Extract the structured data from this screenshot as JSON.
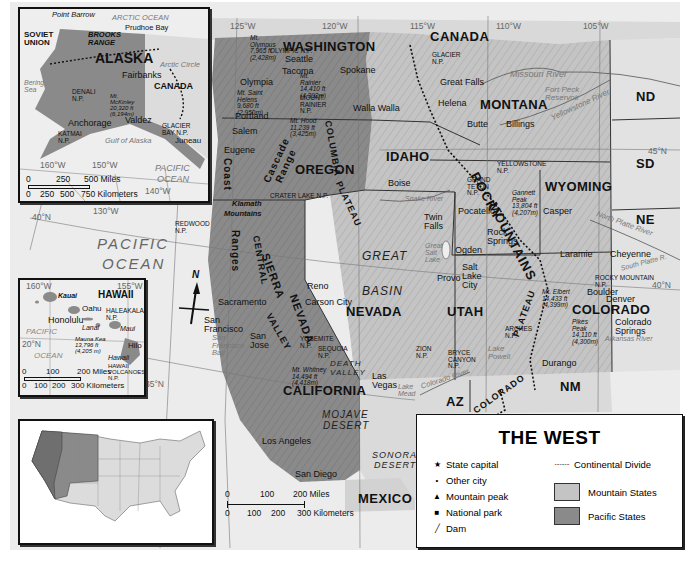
{
  "title": "THE WEST",
  "legend": {
    "title": "THE WEST",
    "items": [
      {
        "symbol": "★",
        "icon": "star-icon",
        "label": "State capital"
      },
      {
        "symbol": "•",
        "icon": "dot-icon",
        "label": "Other city"
      },
      {
        "symbol": "▲",
        "icon": "triangle-icon",
        "label": "Mountain peak"
      },
      {
        "symbol": "■",
        "icon": "square-icon",
        "label": "National park"
      },
      {
        "symbol": "╱",
        "icon": "dam-icon",
        "label": "Dam"
      }
    ],
    "line_items": [
      {
        "symbol": "·········",
        "icon": "dotted-line-icon",
        "label": "Continental Divide"
      }
    ],
    "fills": [
      {
        "label": "Mountain States",
        "color": "#c4c4c4"
      },
      {
        "label": "Pacific States",
        "color": "#8a8a8a"
      }
    ]
  },
  "colors": {
    "ocean": "#ececec",
    "mountain_states": "#c4c4c4",
    "pacific_states": "#8a8a8a",
    "outside": "#dcdcdc",
    "border": "#222222"
  },
  "states": {
    "washington": "WASHINGTON",
    "oregon": "OREGON",
    "california": "CALIFORNIA",
    "idaho": "IDAHO",
    "montana": "MONTANA",
    "wyoming": "WYOMING",
    "nevada": "NEVADA",
    "utah": "UTAH",
    "colorado": "COLORADO",
    "nd": "ND",
    "sd": "SD",
    "ne": "NE",
    "az": "AZ",
    "nm": "NM"
  },
  "countries": {
    "canada": "CANADA",
    "mexico": "MEXICO"
  },
  "oceans": {
    "pacific_1": "PACIFIC",
    "pacific_2": "OCEAN"
  },
  "cities": {
    "seattle": "Seattle",
    "tacoma": "Tacoma",
    "olympia": "Olympia",
    "spokane": "Spokane",
    "walla_walla": "Walla Walla",
    "portland": "Portland",
    "salem": "Salem",
    "eugene": "Eugene",
    "boise": "Boise",
    "twin_falls": "Twin Falls",
    "pocatello": "Pocatello",
    "great_falls": "Great Falls",
    "helena": "Helena",
    "butte": "Butte",
    "billings": "Billings",
    "casper": "Casper",
    "laramie": "Laramie",
    "cheyenne": "Cheyenne",
    "rock_springs": "Rock Springs",
    "ogden": "Ogden",
    "salt_lake_city": "Salt Lake City",
    "provo": "Provo",
    "reno": "Reno",
    "carson_city": "Carson City",
    "las_vegas": "Las Vegas",
    "sacramento": "Sacramento",
    "san_francisco": "San Francisco",
    "san_jose": "San Jose",
    "los_angeles": "Los Angeles",
    "san_diego": "San Diego",
    "boulder": "Boulder",
    "denver": "Denver",
    "colorado_springs": "Colorado Springs",
    "durango": "Durango"
  },
  "parks": {
    "olympic": "OLYMPIC N.P.",
    "mount_rainier": "MOUNT RAINIER N.P.",
    "crater_lake": "CRATER LAKE N.P.",
    "redwood": "REDWOOD N.P.",
    "yosemite": "YOSEMITE N.P.",
    "sequoia": "SEQUOIA N.P.",
    "glacier": "GLACIER N.P.",
    "yellowstone": "YELLOWSTONE N.P.",
    "grand_teton": "GRAND TETON N.P.",
    "rocky_mountain": "ROCKY MOUNTAIN N.P.",
    "arches": "ARCHES N.P.",
    "zion": "ZION N.P.",
    "bryce_canyon": "BRYCE CANYON N.P."
  },
  "peaks": {
    "olympus": "Mt. Olympus 7,965 ft (2,428m)",
    "rainier": "Mt. Rainier 14,410 ft (4,392m)",
    "st_helens": "Mt. Saint Helens 9,680 ft (2,950m)",
    "hood": "Mt. Hood 11,239 ft (3,425m)",
    "whitney": "Mt. Whitney 14,494 ft (4,418m)",
    "gannett": "Gannett Peak 13,804 ft (4,207m)",
    "elbert": "Mt. Elbert 14,433 ft (4,399m)",
    "pikes": "Pikes Peak 14,110 ft (4,300m)"
  },
  "regions": {
    "rocky": "ROCKY",
    "mountains": "MOUNTAINS",
    "great": "GREAT",
    "basin": "BASIN",
    "sierra": "SIERRA",
    "nevada_range": "NEVADA",
    "central": "CENTRAL",
    "valley": "VALLEY",
    "coast": "Coast",
    "ranges": "Ranges",
    "cascade": "Cascade",
    "range": "Range",
    "klamath": "Klamath",
    "mountains_klamath": "Mountains",
    "columbia": "COLUMBIA",
    "plateau": "PLATEAU",
    "colorado_plateau_1": "COLORADO",
    "colorado_plateau_2": "PLATEAU",
    "mojave": "MOJAVE",
    "desert": "DESERT",
    "sonora": "SONORA",
    "sonora_desert": "DESERT",
    "death": "DEATH",
    "death_valley": "VALLEY",
    "continental_divide": "CONTINENTAL DIVIDE",
    "willamette": "WILLAMETTE VALLEY"
  },
  "water": {
    "missouri_river": "Missouri River",
    "fort_peck": "Fort Peck Reservoir",
    "yellowstone_river": "Yellowstone River",
    "snake_river": "Snake River",
    "great_salt_lake": "Great Salt Lake",
    "lake_powell": "Lake Powell",
    "lake_mead": "Lake Mead",
    "colorado_river": "Colorado River",
    "north_platte": "North Platte River",
    "south_platte": "South Platte R.",
    "arkansas_river": "Arkansas River",
    "rio_grande": "Rio Grande",
    "sf_bay": "San Francisco Bay",
    "puget_sound": "Puget Sound"
  },
  "grid": {
    "lon_125": "125°W",
    "lon_120": "120°W",
    "lon_115": "115°W",
    "lon_110": "110°W",
    "lon_105": "105°W",
    "lon_130": "130°W",
    "lat_45": "45°N",
    "lat_40": "40°N",
    "lat_40w": "40°N",
    "lat_35": "35°N"
  },
  "scale": {
    "miles": [
      "0",
      "100",
      "200 Miles"
    ],
    "km": [
      "0",
      "100",
      "200",
      "300 Kilometers"
    ]
  },
  "compass": {
    "north": "N"
  },
  "alaska_inset": {
    "title": "ALASKA",
    "labels": {
      "soviet_union": "SOVIET UNION",
      "canada": "CANADA",
      "point_barrow": "Point Barrow",
      "prudhoe_bay": "Prudhoe Bay",
      "arctic_ocean": "ARCTIC OCEAN",
      "brooks_range": "BROOKS RANGE",
      "arctic_circle": "Arctic Circle",
      "bering_sea": "Bering Sea",
      "fairbanks": "Fairbanks",
      "denali": "DENALI N.P.",
      "mckinley": "Mt. McKinley 20,320 ft (6,194m)",
      "alaska_range": "ALASKA RANGE",
      "anchorage": "Anchorage",
      "valdez": "Valdez",
      "katmai": "KATMAI N.P.",
      "glacier_bay": "GLACIER BAY N.P.",
      "juneau": "Juneau",
      "gulf": "Gulf of Alaska",
      "pacific": "PACIFIC",
      "ocean": "OCEAN",
      "lon_160": "160°W",
      "lon_150": "150°W",
      "lon_140": "140°W",
      "lat_60": "60°N",
      "lat_70": "70°N"
    },
    "scale": {
      "miles": [
        "0",
        "250",
        "500 Miles"
      ],
      "km": [
        "0",
        "250",
        "500",
        "750 Kilometers"
      ]
    }
  },
  "hawaii_inset": {
    "title": "HAWAII",
    "labels": {
      "kauai": "Kauai",
      "oahu": "Oahu",
      "honolulu": "Honolulu",
      "haleakala": "HALEAKALA N.P.",
      "lanai": "Lanai",
      "maui": "Maui",
      "mauna_kea": "Mauna Kea 13,796 ft (4,205 m)",
      "hilo": "Hilo",
      "hawaii": "Hawaii",
      "volcanoes": "HAWAII VOLCANOES N.P.",
      "pacific": "PACIFIC",
      "ocean": "OCEAN",
      "lon_160": "160°W",
      "lon_155": "155°W",
      "lat_20": "20°N"
    },
    "scale": {
      "miles": [
        "0",
        "100",
        "200 Miles"
      ],
      "km": [
        "0",
        "100",
        "200",
        "300 Kilometers"
      ]
    }
  },
  "us_locator": {
    "highlight": "Western states"
  }
}
